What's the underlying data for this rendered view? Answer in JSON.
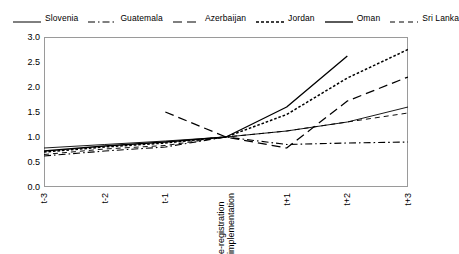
{
  "legend": {
    "position": "top",
    "entries": [
      {
        "label": "Slovenia",
        "style": "solid-thin",
        "icon": "line-solid-icon"
      },
      {
        "label": "Guatemala",
        "style": "dash-dot",
        "icon": "line-dash-dot-icon"
      },
      {
        "label": "Azerbaijan",
        "style": "long-dash",
        "icon": "line-long-dash-icon"
      },
      {
        "label": "Jordan",
        "style": "dotted",
        "icon": "line-dotted-icon"
      },
      {
        "label": "Oman",
        "style": "solid-bold",
        "icon": "line-solid-bold-icon"
      },
      {
        "label": "Sri Lanka",
        "style": "med-dash",
        "icon": "line-med-dash-icon"
      }
    ]
  },
  "axes": {
    "y": {
      "label": "",
      "min": 0.0,
      "max": 3.0,
      "step": 0.5,
      "ticks": [
        "0.0",
        "0.5",
        "1.0",
        "1.5",
        "2.0",
        "2.5",
        "3.0"
      ]
    },
    "x": {
      "label": "",
      "ticks": [
        {
          "text": "t-3"
        },
        {
          "text": "t-2"
        },
        {
          "text": "t-1"
        },
        {
          "text": "e-registration",
          "text2": "implementation"
        },
        {
          "text": "t+1"
        },
        {
          "text": "t+2"
        },
        {
          "text": "t+3"
        }
      ]
    },
    "grid": false
  },
  "chart_data": {
    "type": "line",
    "title": "",
    "subtitle": "",
    "xlabel": "",
    "ylabel": "",
    "xlim": [
      0,
      6
    ],
    "ylim": [
      0.0,
      3.0
    ],
    "grid": false,
    "legend_position": "top",
    "x": [
      "t-3",
      "t-2",
      "t-1",
      "e-registration implementation",
      "t+1",
      "t+2",
      "t+3"
    ],
    "annotations": [],
    "series": [
      {
        "name": "Slovenia",
        "style": "solid-thin",
        "color": "#000000",
        "values": [
          0.78,
          0.85,
          0.92,
          1.0,
          1.12,
          1.3,
          1.6
        ]
      },
      {
        "name": "Guatemala",
        "style": "dash-dot",
        "color": "#000000",
        "values": [
          0.62,
          0.72,
          0.8,
          1.0,
          0.85,
          0.88,
          0.9
        ]
      },
      {
        "name": "Azerbaijan",
        "style": "long-dash",
        "color": "#000000",
        "values": [
          null,
          null,
          1.5,
          1.0,
          0.78,
          1.72,
          2.2
        ]
      },
      {
        "name": "Jordan",
        "style": "dotted",
        "color": "#000000",
        "values": [
          0.7,
          0.8,
          0.88,
          1.0,
          1.45,
          2.18,
          2.75
        ]
      },
      {
        "name": "Oman",
        "style": "solid-bold",
        "color": "#000000",
        "values": [
          0.72,
          0.82,
          0.9,
          1.0,
          1.6,
          2.62,
          null
        ]
      },
      {
        "name": "Sri Lanka",
        "style": "med-dash",
        "color": "#000000",
        "values": [
          0.65,
          0.76,
          0.83,
          1.0,
          1.12,
          1.3,
          1.48
        ]
      }
    ]
  }
}
